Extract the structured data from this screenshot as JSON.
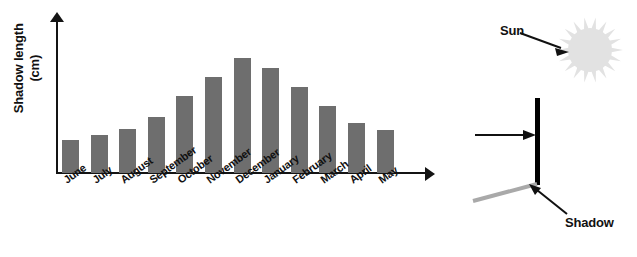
{
  "chart_data": {
    "type": "bar",
    "title": "",
    "xlabel": "",
    "ylabel": "Shadow length (cm)",
    "ylabel_line1": "Shadow length",
    "ylabel_line2": "(cm)",
    "grid": false,
    "legend": "none",
    "ylim": [
      0,
      160
    ],
    "bar_color": "#6e6e6e",
    "categories": [
      "June",
      "July",
      "August",
      "September",
      "October",
      "November",
      "December",
      "January",
      "February",
      "March",
      "April",
      "May"
    ],
    "values": [
      35,
      40,
      46,
      59,
      80,
      100,
      120,
      110,
      90,
      70,
      52,
      45
    ]
  },
  "diagram": {
    "sun_label": "Sun",
    "shadow_label": "Shadow",
    "sun_color": "#e2e2e2",
    "stick_color": "#000000",
    "shadow_color": "#a9a9a9",
    "arrow_color": "#111111"
  }
}
